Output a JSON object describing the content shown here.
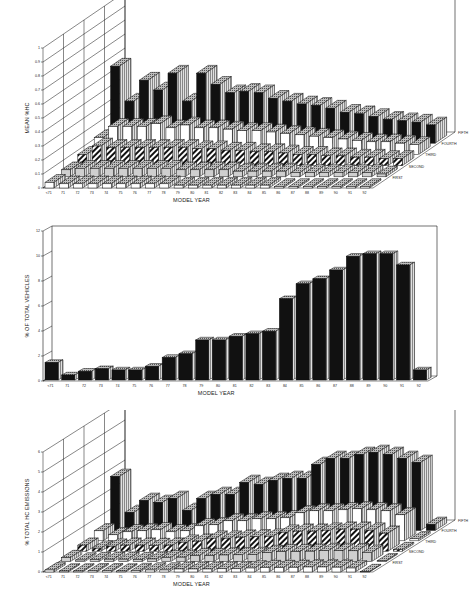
{
  "chart_data": [
    {
      "type": "bar",
      "subtype": "3d-grouped-bar",
      "title": "",
      "xlabel": "MODEL YEAR",
      "ylabel": "MEAN %HC",
      "ylim": [
        0,
        1
      ],
      "yticks": [
        "0",
        "0.1",
        "0.2",
        "0.3",
        "0.4",
        "0.5",
        "0.6",
        "0.7",
        "0.8",
        "0.9",
        "1"
      ],
      "grid": true,
      "categories": [
        "<71",
        "71",
        "72",
        "73",
        "74",
        "75",
        "76",
        "77",
        "78",
        "79",
        "80",
        "81",
        "82",
        "83",
        "84",
        "85",
        "86",
        "87",
        "88",
        "89",
        "90",
        "91",
        "92"
      ],
      "series": [
        {
          "name": "FIRST",
          "values": [
            0.04,
            0.03,
            0.03,
            0.03,
            0.03,
            0.03,
            0.03,
            0.03,
            0.03,
            0.02,
            0.02,
            0.02,
            0.02,
            0.02,
            0.02,
            0.02,
            0.01,
            0.01,
            0.01,
            0.01,
            0.01,
            0.01,
            0.01
          ]
        },
        {
          "name": "SECOND",
          "values": [
            0.05,
            0.06,
            0.06,
            0.06,
            0.06,
            0.06,
            0.06,
            0.06,
            0.05,
            0.05,
            0.05,
            0.05,
            0.04,
            0.04,
            0.04,
            0.04,
            0.03,
            0.03,
            0.03,
            0.03,
            0.03,
            0.03,
            0.02
          ]
        },
        {
          "name": "THIRD",
          "values": [
            0.08,
            0.14,
            0.13,
            0.13,
            0.13,
            0.13,
            0.13,
            0.13,
            0.12,
            0.12,
            0.11,
            0.11,
            0.1,
            0.1,
            0.09,
            0.08,
            0.08,
            0.07,
            0.07,
            0.06,
            0.06,
            0.05,
            0.05
          ]
        },
        {
          "name": "FOURTH",
          "values": [
            0.12,
            0.2,
            0.2,
            0.2,
            0.22,
            0.19,
            0.21,
            0.19,
            0.19,
            0.18,
            0.17,
            0.17,
            0.16,
            0.15,
            0.14,
            0.13,
            0.12,
            0.11,
            0.1,
            0.09,
            0.09,
            0.08,
            0.07
          ]
        },
        {
          "name": "FIFTH",
          "values": [
            0.55,
            0.3,
            0.45,
            0.38,
            0.5,
            0.3,
            0.5,
            0.42,
            0.36,
            0.37,
            0.36,
            0.32,
            0.3,
            0.28,
            0.27,
            0.25,
            0.22,
            0.21,
            0.19,
            0.17,
            0.16,
            0.15,
            0.13
          ]
        }
      ],
      "legend": "row labels on depth axis (right)"
    },
    {
      "type": "bar",
      "subtype": "3d-bar",
      "title": "",
      "xlabel": "MODEL YEAR",
      "ylabel": "% OF TOTAL VEHICLES",
      "ylim": [
        0,
        12
      ],
      "yticks": [
        "0",
        "2",
        "4",
        "6",
        "8",
        "10",
        "12"
      ],
      "grid": false,
      "categories": [
        "<71",
        "71",
        "72",
        "73",
        "74",
        "75",
        "76",
        "77",
        "78",
        "79",
        "80",
        "81",
        "82",
        "83",
        "84",
        "85",
        "86",
        "87",
        "88",
        "89",
        "90",
        "91",
        "92"
      ],
      "values": [
        1.4,
        0.4,
        0.7,
        0.9,
        0.8,
        0.8,
        1.1,
        1.8,
        2.1,
        3.2,
        3.2,
        3.5,
        3.7,
        3.9,
        6.5,
        7.7,
        8.1,
        8.8,
        9.9,
        10.1,
        10.1,
        9.2,
        0.8
      ]
    },
    {
      "type": "bar",
      "subtype": "3d-grouped-bar",
      "title": "",
      "xlabel": "MODEL YEAR",
      "ylabel": "% TOTAL HC EMISSIONS",
      "ylim": [
        0,
        6
      ],
      "yticks": [
        "0",
        "1",
        "2",
        "3",
        "4",
        "5",
        "6"
      ],
      "grid": true,
      "categories": [
        "<71",
        "71",
        "72",
        "73",
        "74",
        "75",
        "76",
        "77",
        "78",
        "79",
        "80",
        "81",
        "82",
        "83",
        "84",
        "85",
        "86",
        "87",
        "88",
        "89",
        "90",
        "91",
        "92"
      ],
      "series": [
        {
          "name": "FIRST",
          "values": [
            0.1,
            0.05,
            0.05,
            0.06,
            0.06,
            0.05,
            0.07,
            0.1,
            0.1,
            0.15,
            0.15,
            0.15,
            0.16,
            0.16,
            0.2,
            0.22,
            0.22,
            0.23,
            0.25,
            0.25,
            0.24,
            0.2,
            0.02
          ]
        },
        {
          "name": "SECOND",
          "values": [
            0.2,
            0.08,
            0.1,
            0.12,
            0.12,
            0.1,
            0.13,
            0.2,
            0.22,
            0.3,
            0.3,
            0.33,
            0.34,
            0.35,
            0.45,
            0.5,
            0.5,
            0.52,
            0.55,
            0.55,
            0.54,
            0.46,
            0.04
          ]
        },
        {
          "name": "THIRD",
          "values": [
            0.3,
            0.15,
            0.25,
            0.3,
            0.3,
            0.28,
            0.3,
            0.45,
            0.5,
            0.65,
            0.65,
            0.7,
            0.72,
            0.75,
            0.95,
            1.0,
            1.0,
            1.05,
            1.1,
            1.1,
            1.05,
            0.9,
            0.08
          ]
        },
        {
          "name": "FOURTH",
          "values": [
            0.5,
            0.3,
            0.45,
            0.5,
            0.55,
            0.45,
            0.5,
            0.75,
            0.8,
            1.0,
            1.0,
            1.1,
            1.1,
            1.15,
            1.4,
            1.5,
            1.5,
            1.55,
            1.6,
            1.55,
            1.5,
            1.3,
            0.1
          ]
        },
        {
          "name": "FIFTH",
          "values": [
            2.7,
            0.9,
            1.5,
            1.4,
            1.6,
            1.0,
            1.6,
            1.8,
            1.8,
            2.4,
            2.3,
            2.5,
            2.6,
            2.6,
            3.3,
            3.6,
            3.6,
            3.8,
            3.9,
            3.8,
            3.6,
            3.4,
            0.3
          ]
        }
      ],
      "legend": "row labels on depth axis (right)"
    }
  ]
}
